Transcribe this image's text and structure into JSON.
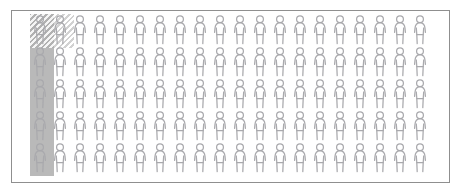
{
  "figure": {
    "frame": {
      "border_color": "#8f8f8f",
      "background_color": "#ffffff"
    },
    "grid": {
      "columns": 20,
      "rows": 5,
      "total_icons": 100,
      "icon_name": "person-figure-icon",
      "icon_stroke_color": "#a9a9ad",
      "cell_width_px": 20,
      "cell_height_px": 32
    },
    "highlights": [
      {
        "name": "column-highlight",
        "style": "solid-fill",
        "color": "#b9b9b9",
        "covers_columns": 1,
        "covers_rows": 5,
        "icon_count": 5
      },
      {
        "name": "hatched-selection",
        "style": "diagonal-hatch",
        "color": "#acacac",
        "covers_columns": 2,
        "covers_rows": 1,
        "icon_count": 2
      }
    ]
  },
  "chart_data": {
    "type": "pictogram",
    "unit_icon": "person-figure-icon",
    "total_units": 100,
    "columns": 20,
    "rows": 5,
    "series": [
      {
        "name": "Column highlight (solid gray)",
        "values": [
          5
        ]
      },
      {
        "name": "Hatched selection",
        "values": [
          2
        ]
      },
      {
        "name": "Unhighlighted",
        "values": [
          93
        ]
      }
    ],
    "legend_position": "none",
    "grid": false
  }
}
